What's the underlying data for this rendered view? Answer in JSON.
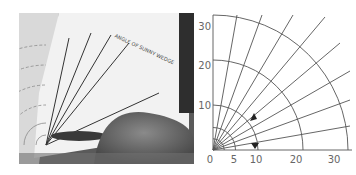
{
  "figure": {
    "left_panel": {
      "kind": "photograph",
      "description": "Hand holding a polar grid protractor card",
      "card_title_text": "ANGLE OF SUNNY WEDGE",
      "card_axis_labels": [
        "0",
        "5",
        "10",
        "20",
        "30"
      ]
    },
    "right_panel": {
      "kind": "polar-grid-diagram",
      "x_axis_ticks": [
        "0",
        "5",
        "10",
        "20",
        "30"
      ],
      "y_axis_ticks": [
        "10",
        "20",
        "30"
      ],
      "arc_radii": [
        5,
        10,
        20,
        30
      ],
      "radial_angles_deg": [
        10,
        20,
        30,
        40,
        50,
        60,
        70,
        80
      ],
      "markers": [
        {
          "shape": "triangle-down",
          "x": 10,
          "y": 0.5
        },
        {
          "shape": "triangle-up",
          "x": 9.5,
          "y": 7
        }
      ],
      "line_color": "#555555",
      "label_color": "#666666"
    }
  }
}
